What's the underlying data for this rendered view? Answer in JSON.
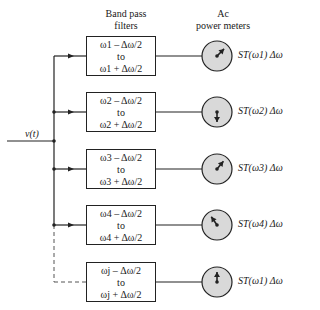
{
  "headers": {
    "filters": [
      "Band pass",
      "filters"
    ],
    "meters": [
      "Ac",
      "power meters"
    ]
  },
  "input_label": "v(t)",
  "channels": [
    {
      "lower": "ω1 – Δω/2",
      "middle": "to",
      "upper": "ω1 + Δω/2",
      "output": "ST(ω1) Δω",
      "needle_deg": 45,
      "connection": "solid"
    },
    {
      "lower": "ω2 – Δω/2",
      "middle": "to",
      "upper": "ω2 + Δω/2",
      "output": "ST(ω2) Δω",
      "needle_deg": 180,
      "connection": "solid"
    },
    {
      "lower": "ω3 – Δω/2",
      "middle": "to",
      "upper": "ω3 + Δω/2",
      "output": "ST(ω3) Δω",
      "needle_deg": 40,
      "connection": "solid"
    },
    {
      "lower": "ω4 – Δω/2",
      "middle": "to",
      "upper": "ω4 + Δω/2",
      "output": "ST(ω4) Δω",
      "needle_deg": -35,
      "connection": "solid"
    },
    {
      "lower": "ωj – Δω/2",
      "middle": "to",
      "upper": "ωj + Δω/2",
      "output": "ST(ω1) Δω",
      "needle_deg": 0,
      "connection": "dashed"
    }
  ],
  "colors": {
    "line": "#222222",
    "meter_fill": "#d9d9d9"
  }
}
